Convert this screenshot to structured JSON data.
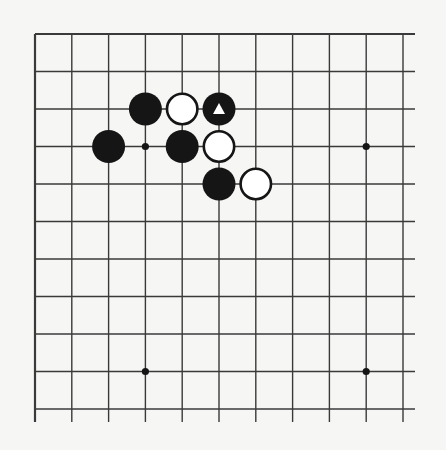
{
  "diagram": {
    "type": "go-board-partial",
    "grid": {
      "columns": 11,
      "rows": 11,
      "origin_x": 35,
      "origin_y": 34,
      "spacing_x": 36.8,
      "spacing_y": 37.5,
      "line_extend_right": 12,
      "line_extend_bottom": 13,
      "edge_top": true,
      "edge_left": true
    },
    "colors": {
      "background": "#f6f6f5",
      "line": "#3a3a3a",
      "black_stone": "#151515",
      "white_stone_fill": "#ffffff",
      "white_stone_stroke": "#151515",
      "marker": "#ffffff"
    },
    "stone_radius": 16.5,
    "hoshi": [
      {
        "col": 3,
        "row": 3
      },
      {
        "col": 9,
        "row": 3
      },
      {
        "col": 3,
        "row": 9
      },
      {
        "col": 9,
        "row": 9
      }
    ],
    "stones": [
      {
        "col": 3,
        "row": 2,
        "color": "black",
        "marker": null
      },
      {
        "col": 4,
        "row": 2,
        "color": "white",
        "marker": null
      },
      {
        "col": 5,
        "row": 2,
        "color": "black",
        "marker": "triangle"
      },
      {
        "col": 2,
        "row": 3,
        "color": "black",
        "marker": null
      },
      {
        "col": 4,
        "row": 3,
        "color": "black",
        "marker": null
      },
      {
        "col": 5,
        "row": 3,
        "color": "white",
        "marker": null
      },
      {
        "col": 5,
        "row": 4,
        "color": "black",
        "marker": null
      },
      {
        "col": 6,
        "row": 4,
        "color": "white",
        "marker": null
      }
    ]
  }
}
